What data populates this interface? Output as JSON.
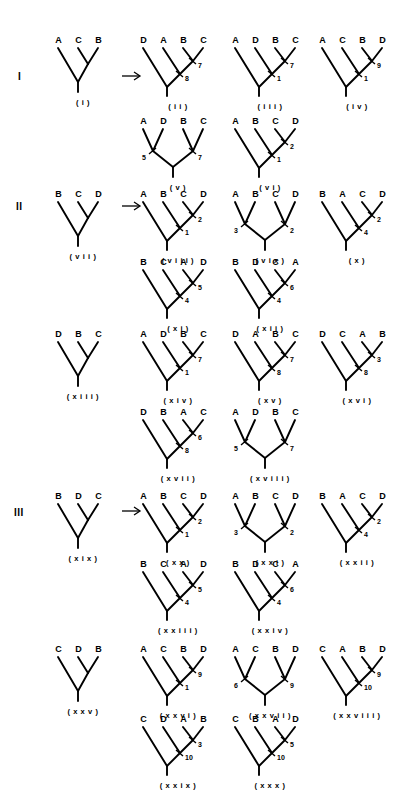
{
  "figure": {
    "width": 415,
    "height": 805,
    "background": "#ffffff",
    "ink": "#000000",
    "sections": [
      "I",
      "II",
      "III"
    ]
  },
  "section_labels": [
    {
      "text": "I",
      "x": 18,
      "y": 72
    },
    {
      "text": "II",
      "x": 16,
      "y": 202
    },
    {
      "text": "III",
      "x": 14,
      "y": 508
    }
  ],
  "arrows": [
    {
      "name": "arrow-section-1",
      "x": 122,
      "y": 70
    },
    {
      "name": "arrow-section-2",
      "x": 122,
      "y": 200
    },
    {
      "name": "arrow-section-3",
      "x": 122,
      "y": 505
    },
    {
      "name": "arrow-section-4",
      "x": 122,
      "y": 330
    },
    {
      "name": "arrow-section-5",
      "x": 122,
      "y": 660
    }
  ],
  "trees": [
    {
      "id": "i",
      "caption": "( i )",
      "x": 58,
      "y": 36,
      "taxa": [
        "A",
        "C",
        "B"
      ],
      "shape": "source3",
      "numbers": []
    },
    {
      "id": "ii",
      "caption": "( i i )",
      "x": 143,
      "y": 36,
      "taxa": [
        "D",
        "A",
        "B",
        "C"
      ],
      "shape": "ladder",
      "numbers": [
        {
          "text": "7",
          "pos": "upper"
        },
        {
          "text": "8",
          "pos": "lower"
        }
      ]
    },
    {
      "id": "iii",
      "caption": "( i i i )",
      "x": 235,
      "y": 36,
      "taxa": [
        "A",
        "D",
        "B",
        "C"
      ],
      "shape": "ladder",
      "numbers": [
        {
          "text": "7",
          "pos": "upper"
        },
        {
          "text": "1",
          "pos": "lower"
        }
      ]
    },
    {
      "id": "iv",
      "caption": "( i v )",
      "x": 322,
      "y": 36,
      "taxa": [
        "A",
        "C",
        "B",
        "D"
      ],
      "shape": "ladder",
      "numbers": [
        {
          "text": "9",
          "pos": "upper"
        },
        {
          "text": "1",
          "pos": "lower"
        }
      ]
    },
    {
      "id": "v",
      "caption": "( v )",
      "x": 143,
      "y": 117,
      "taxa": [
        "A",
        "D",
        "B",
        "C"
      ],
      "shape": "balanced",
      "numbers": [
        {
          "text": "5",
          "pos": "left"
        },
        {
          "text": "7",
          "pos": "right"
        }
      ]
    },
    {
      "id": "vi",
      "caption": "( v i )",
      "x": 235,
      "y": 117,
      "taxa": [
        "A",
        "B",
        "C",
        "D"
      ],
      "shape": "ladder",
      "numbers": [
        {
          "text": "2",
          "pos": "upper"
        },
        {
          "text": "1",
          "pos": "lower"
        }
      ]
    },
    {
      "id": "vii",
      "caption": "( v i i )",
      "x": 58,
      "y": 190,
      "taxa": [
        "B",
        "C",
        "D"
      ],
      "shape": "source3",
      "numbers": []
    },
    {
      "id": "viii",
      "caption": "( v i i i )",
      "x": 143,
      "y": 190,
      "taxa": [
        "A",
        "B",
        "C",
        "D"
      ],
      "shape": "ladder",
      "numbers": [
        {
          "text": "2",
          "pos": "upper"
        },
        {
          "text": "1",
          "pos": "lower"
        }
      ]
    },
    {
      "id": "vix",
      "caption": "( v i x )",
      "x": 235,
      "y": 190,
      "taxa": [
        "A",
        "B",
        "C",
        "D"
      ],
      "shape": "balanced",
      "numbers": [
        {
          "text": "3",
          "pos": "left"
        },
        {
          "text": "2",
          "pos": "right"
        }
      ]
    },
    {
      "id": "x",
      "caption": "( x )",
      "x": 322,
      "y": 190,
      "taxa": [
        "B",
        "A",
        "C",
        "D"
      ],
      "shape": "ladder",
      "numbers": [
        {
          "text": "2",
          "pos": "upper"
        },
        {
          "text": "4",
          "pos": "lower"
        }
      ]
    },
    {
      "id": "xi",
      "caption": "( x i )",
      "x": 143,
      "y": 258,
      "taxa": [
        "B",
        "C",
        "A",
        "D"
      ],
      "shape": "ladder",
      "numbers": [
        {
          "text": "5",
          "pos": "upper"
        },
        {
          "text": "4",
          "pos": "lower"
        }
      ]
    },
    {
      "id": "xii",
      "caption": "( x i i )",
      "x": 235,
      "y": 258,
      "taxa": [
        "B",
        "D",
        "C",
        "A"
      ],
      "shape": "ladder",
      "numbers": [
        {
          "text": "6",
          "pos": "upper"
        },
        {
          "text": "4",
          "pos": "lower"
        }
      ]
    },
    {
      "id": "xiii",
      "caption": "( x i i i )",
      "x": 58,
      "y": 330,
      "taxa": [
        "D",
        "B",
        "C"
      ],
      "shape": "source3",
      "numbers": []
    },
    {
      "id": "xiv",
      "caption": "( x i v )",
      "x": 143,
      "y": 330,
      "taxa": [
        "A",
        "D",
        "B",
        "C"
      ],
      "shape": "ladder",
      "numbers": [
        {
          "text": "7",
          "pos": "upper"
        },
        {
          "text": "1",
          "pos": "lower"
        }
      ]
    },
    {
      "id": "xv",
      "caption": "( x v )",
      "x": 235,
      "y": 330,
      "taxa": [
        "D",
        "A",
        "B",
        "C"
      ],
      "shape": "ladder",
      "numbers": [
        {
          "text": "7",
          "pos": "upper"
        },
        {
          "text": "8",
          "pos": "lower"
        }
      ]
    },
    {
      "id": "xvi",
      "caption": "( x v i )",
      "x": 322,
      "y": 330,
      "taxa": [
        "D",
        "C",
        "A",
        "B"
      ],
      "shape": "ladder",
      "numbers": [
        {
          "text": "3",
          "pos": "upper"
        },
        {
          "text": "8",
          "pos": "lower"
        }
      ]
    },
    {
      "id": "xvii",
      "caption": "( x v i i )",
      "x": 143,
      "y": 408,
      "taxa": [
        "D",
        "B",
        "A",
        "C"
      ],
      "shape": "ladder",
      "numbers": [
        {
          "text": "6",
          "pos": "upper"
        },
        {
          "text": "8",
          "pos": "lower"
        }
      ]
    },
    {
      "id": "xviii",
      "caption": "( x v i i i )",
      "x": 235,
      "y": 408,
      "taxa": [
        "A",
        "D",
        "B",
        "C"
      ],
      "shape": "balanced",
      "numbers": [
        {
          "text": "5",
          "pos": "left"
        },
        {
          "text": "7",
          "pos": "right"
        }
      ]
    },
    {
      "id": "xix",
      "caption": "( x i x )",
      "x": 58,
      "y": 492,
      "taxa": [
        "B",
        "D",
        "C"
      ],
      "shape": "source3",
      "numbers": []
    },
    {
      "id": "xx",
      "caption": "( x x )",
      "x": 143,
      "y": 492,
      "taxa": [
        "A",
        "B",
        "C",
        "D"
      ],
      "shape": "ladder",
      "numbers": [
        {
          "text": "2",
          "pos": "upper"
        },
        {
          "text": "1",
          "pos": "lower"
        }
      ]
    },
    {
      "id": "xxi",
      "caption": "( x x i )",
      "x": 235,
      "y": 492,
      "taxa": [
        "A",
        "B",
        "C",
        "D"
      ],
      "shape": "balanced",
      "numbers": [
        {
          "text": "3",
          "pos": "left"
        },
        {
          "text": "2",
          "pos": "right"
        }
      ]
    },
    {
      "id": "xxii",
      "caption": "( x x i i )",
      "x": 322,
      "y": 492,
      "taxa": [
        "B",
        "A",
        "C",
        "D"
      ],
      "shape": "ladder",
      "numbers": [
        {
          "text": "2",
          "pos": "upper"
        },
        {
          "text": "4",
          "pos": "lower"
        }
      ]
    },
    {
      "id": "xxiii",
      "caption": "( x x i i i )",
      "x": 143,
      "y": 560,
      "taxa": [
        "B",
        "C",
        "A",
        "D"
      ],
      "shape": "ladder",
      "numbers": [
        {
          "text": "5",
          "pos": "upper"
        },
        {
          "text": "4",
          "pos": "lower"
        }
      ]
    },
    {
      "id": "xxiv",
      "caption": "( x x i v )",
      "x": 235,
      "y": 560,
      "taxa": [
        "B",
        "D",
        "C",
        "A"
      ],
      "shape": "ladder",
      "numbers": [
        {
          "text": "6",
          "pos": "upper"
        },
        {
          "text": "4",
          "pos": "lower"
        }
      ]
    },
    {
      "id": "xxv",
      "caption": "( x x v )",
      "x": 58,
      "y": 645,
      "taxa": [
        "C",
        "D",
        "B"
      ],
      "shape": "source3",
      "numbers": []
    },
    {
      "id": "xxvi",
      "caption": "( x x v i )",
      "x": 143,
      "y": 645,
      "taxa": [
        "A",
        "C",
        "B",
        "D"
      ],
      "shape": "ladder",
      "numbers": [
        {
          "text": "9",
          "pos": "upper"
        },
        {
          "text": "1",
          "pos": "lower"
        }
      ]
    },
    {
      "id": "xxvii",
      "caption": "( x x v i i )",
      "x": 235,
      "y": 645,
      "taxa": [
        "A",
        "C",
        "B",
        "D"
      ],
      "shape": "balanced",
      "numbers": [
        {
          "text": "6",
          "pos": "left"
        },
        {
          "text": "9",
          "pos": "right"
        }
      ]
    },
    {
      "id": "xxviii",
      "caption": "( x x v i i i )",
      "x": 322,
      "y": 645,
      "taxa": [
        "C",
        "A",
        "B",
        "D"
      ],
      "shape": "ladder",
      "numbers": [
        {
          "text": "9",
          "pos": "upper"
        },
        {
          "text": "10",
          "pos": "lower"
        }
      ]
    },
    {
      "id": "xxix",
      "caption": "( x x i x )",
      "x": 143,
      "y": 715,
      "taxa": [
        "C",
        "D",
        "A",
        "B"
      ],
      "shape": "ladder",
      "numbers": [
        {
          "text": "3",
          "pos": "upper"
        },
        {
          "text": "10",
          "pos": "lower"
        }
      ]
    },
    {
      "id": "xxx",
      "caption": "( x x x )",
      "x": 235,
      "y": 715,
      "taxa": [
        "C",
        "B",
        "A",
        "D"
      ],
      "shape": "ladder",
      "numbers": [
        {
          "text": "5",
          "pos": "upper"
        },
        {
          "text": "10",
          "pos": "lower"
        }
      ]
    }
  ]
}
